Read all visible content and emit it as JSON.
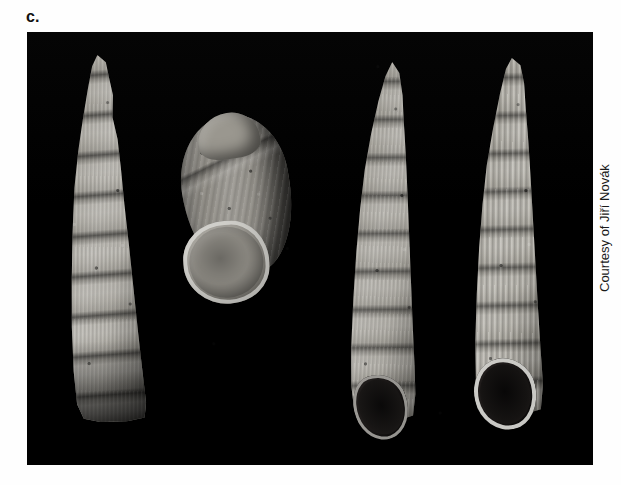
{
  "figure": {
    "panel_label": "c.",
    "credit": "Courtesy of Jiří Novák",
    "plate_background_color": "#000000",
    "page_background_color": "#ffffff",
    "label_color": "#111111",
    "credit_color": "#1a1a1a"
  },
  "specimens": [
    {
      "id": "specimen-1",
      "description": "elongate tapering gastropod shell, spire view",
      "shell_color": "#a8a59d"
    },
    {
      "id": "specimen-2",
      "description": "broad ovate gastropod shell with large pale aperture",
      "shell_color": "#8f8c85",
      "aperture_color": "#9d9a92"
    },
    {
      "id": "specimen-3",
      "description": "elongate gastropod shell with dark basal aperture",
      "shell_color": "#a5a29a",
      "aperture_color": "#231f1e"
    },
    {
      "id": "specimen-4",
      "description": "elongate ribbed gastropod shell with bright-lipped dark aperture",
      "shell_color": "#aba89f",
      "aperture_color": "#221e1d"
    }
  ]
}
